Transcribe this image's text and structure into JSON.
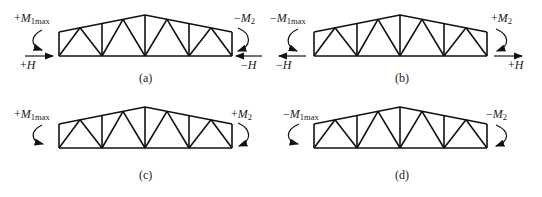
{
  "panels": [
    {
      "id": "a",
      "caption": "(a)",
      "left_moment": {
        "sign": "+",
        "symbol": "M",
        "sub": "1max"
      },
      "right_moment": {
        "sign": "−",
        "symbol": "M",
        "sub": "2"
      },
      "left_force": {
        "sign": "+",
        "symbol": "H"
      },
      "right_force": {
        "sign": "−",
        "symbol": "H"
      }
    },
    {
      "id": "b",
      "caption": "(b)",
      "left_moment": {
        "sign": "−",
        "symbol": "M",
        "sub": "1max"
      },
      "right_moment": {
        "sign": "+",
        "symbol": "M",
        "sub": "2"
      },
      "left_force": {
        "sign": "−",
        "symbol": "H"
      },
      "right_force": {
        "sign": "+",
        "symbol": "H"
      }
    },
    {
      "id": "c",
      "caption": "(c)",
      "left_moment": {
        "sign": "+",
        "symbol": "M",
        "sub": "1max"
      },
      "right_moment": {
        "sign": "+",
        "symbol": "M",
        "sub": "2"
      }
    },
    {
      "id": "d",
      "caption": "(d)",
      "left_moment": {
        "sign": "−",
        "symbol": "M",
        "sub": "1max"
      },
      "right_moment": {
        "sign": "−",
        "symbol": "M",
        "sub": "2"
      }
    }
  ],
  "colors": {
    "line": "#111111",
    "background": "#ffffff"
  }
}
